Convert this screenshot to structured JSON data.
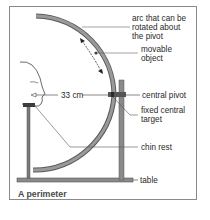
{
  "diagram": {
    "title": "A perimeter",
    "labels": {
      "arc_line1": "arc that can be",
      "arc_line2": "rotated about",
      "arc_line3": "the pivot",
      "movable_line1": "movable",
      "movable_line2": "object",
      "distance": "33 cm",
      "central_pivot": "central pivot",
      "fixed_line1": "fixed central",
      "fixed_line2": "target",
      "chin_rest": "chin rest",
      "table": "table"
    },
    "colors": {
      "arc_fill": "#8c8c8c",
      "arc_edge": "#5a5a5a",
      "stand": "#7a7a7a",
      "leader": "#555555",
      "text": "#2a2a2a",
      "frame": "#8a8a8a"
    }
  }
}
